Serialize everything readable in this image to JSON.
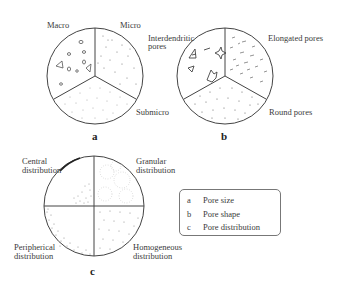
{
  "figure": {
    "panels": [
      {
        "id": "a",
        "label": "a",
        "sectors": [
          {
            "name": "Macro",
            "label": "Macro"
          },
          {
            "name": "Micro",
            "label": "Micro"
          },
          {
            "name": "Submicro",
            "label": "Submicro"
          }
        ]
      },
      {
        "id": "b",
        "label": "b",
        "sectors": [
          {
            "name": "Interdendritic pores",
            "label_line1": "Interdendritic",
            "label_line2": "pores"
          },
          {
            "name": "Elongated pores",
            "label": "Elongated pores"
          },
          {
            "name": "Round pores",
            "label": "Round pores"
          }
        ]
      },
      {
        "id": "c",
        "label": "c",
        "sectors": [
          {
            "name": "Central distribution",
            "label_line1": "Central",
            "label_line2": "distribution"
          },
          {
            "name": "Granular distribution",
            "label_line1": "Granular",
            "label_line2": "distribution"
          },
          {
            "name": "Peripherical distribution",
            "label_line1": "Peripherical",
            "label_line2": "distribution"
          },
          {
            "name": "Homogeneous distribution",
            "label_line1": "Homogeneous",
            "label_line2": "distribution"
          }
        ]
      }
    ],
    "legend": [
      {
        "key": "a",
        "text": "Pore size"
      },
      {
        "key": "b",
        "text": "Pore shape"
      },
      {
        "key": "c",
        "text": "Pore distribution"
      }
    ],
    "colors": {
      "stroke": "#444444",
      "dots": "#777777",
      "background": "#ffffff"
    }
  }
}
